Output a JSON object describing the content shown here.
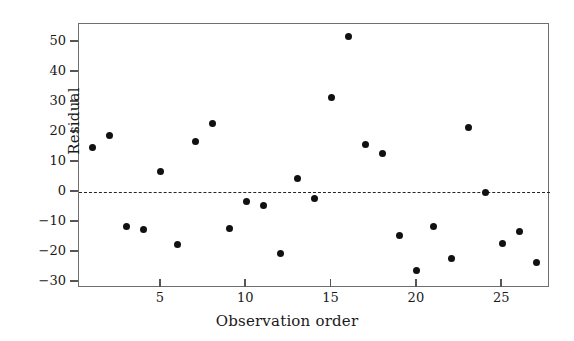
{
  "chart_data": {
    "type": "scatter",
    "title": "",
    "xlabel": "Observation order",
    "ylabel": "Residual",
    "x": [
      1,
      2,
      3,
      4,
      5,
      6,
      7,
      8,
      9,
      10,
      11,
      12,
      13,
      14,
      15,
      16,
      17,
      18,
      19,
      20,
      21,
      22,
      23,
      24,
      25,
      26,
      27
    ],
    "values": [
      15,
      19,
      -11.5,
      -12.5,
      7,
      -17.5,
      17,
      23,
      -12,
      -3,
      -4.5,
      -20.5,
      4.5,
      -2,
      31.5,
      52,
      16,
      13,
      -14.5,
      -26,
      -11.5,
      -22,
      21.5,
      0,
      -17,
      -13,
      -23.5
    ],
    "series": [
      {
        "name": "Residual",
        "values": [
          15,
          19,
          -11.5,
          -12.5,
          7,
          -17.5,
          17,
          23,
          -12,
          -3,
          -4.5,
          -20.5,
          4.5,
          -2,
          31.5,
          52,
          16,
          13,
          -14.5,
          -26,
          -11.5,
          -22,
          21.5,
          0,
          -17,
          -13,
          -23.5
        ]
      }
    ],
    "xlim": [
      0.2,
      27.8
    ],
    "ylim": [
      -32,
      56
    ],
    "yticks": [
      -30,
      -20,
      -10,
      0,
      10,
      20,
      30,
      40,
      50
    ],
    "ytick_labels": [
      "−30",
      "−20",
      "−10",
      "0",
      "10",
      "20",
      "30",
      "40",
      "50"
    ],
    "xticks": [
      5,
      10,
      15,
      20,
      25
    ],
    "xtick_labels": [
      "5",
      "10",
      "15",
      "20",
      "25"
    ],
    "grid": false,
    "legend": "none",
    "reference_line": {
      "name": "zero-reference-line",
      "y": 0,
      "style": "dashed",
      "color": "#262626"
    },
    "marker": {
      "shape": "circle",
      "color": "#111111",
      "size": 7
    },
    "frame_color": "#6f6f6f",
    "background": "#ffffff"
  }
}
